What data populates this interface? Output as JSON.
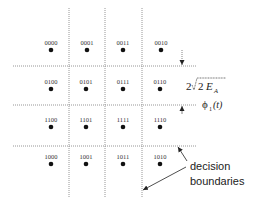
{
  "diagram": {
    "points": [
      {
        "label": "0000",
        "x": 51,
        "y": 50
      },
      {
        "label": "0001",
        "x": 87,
        "y": 50
      },
      {
        "label": "0011",
        "x": 123,
        "y": 50
      },
      {
        "label": "0010",
        "x": 161,
        "y": 50
      },
      {
        "label": "0100",
        "x": 51,
        "y": 89
      },
      {
        "label": "0101",
        "x": 86,
        "y": 89
      },
      {
        "label": "0111",
        "x": 123,
        "y": 89
      },
      {
        "label": "0110",
        "x": 160,
        "y": 89
      },
      {
        "label": "1100",
        "x": 51,
        "y": 127
      },
      {
        "label": "1101",
        "x": 86,
        "y": 127
      },
      {
        "label": "1111",
        "x": 123,
        "y": 127
      },
      {
        "label": "1110",
        "x": 160,
        "y": 127
      },
      {
        "label": "1000",
        "x": 51,
        "y": 164
      },
      {
        "label": "1001",
        "x": 86,
        "y": 164
      },
      {
        "label": "1011",
        "x": 123,
        "y": 164
      },
      {
        "label": "1010",
        "x": 160,
        "y": 164
      }
    ],
    "spacing_label": {
      "prefix": "2",
      "radicand": "2",
      "var": "E",
      "sub": "A"
    },
    "axis_label": {
      "symbol": "ϕ",
      "sub": "1",
      "arg": "(t)"
    },
    "annotation": {
      "line1": "decision",
      "line2": "boundaries"
    },
    "colors": {
      "grid": "#8a8a8a",
      "point": "#111111",
      "text": "#222222"
    }
  }
}
